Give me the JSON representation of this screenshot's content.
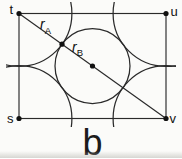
{
  "figure": {
    "type": "unit-cell-atomic-packing-diagram",
    "sublabel": "b",
    "background": "#fbfbf9",
    "line_color": "#2a2a2a",
    "dot_color": "#111111"
  },
  "corner_labels": {
    "top_left": "t",
    "top_right": "u",
    "bottom_left": "s",
    "bottom_right": "v"
  },
  "radius_labels": {
    "corner_atom": {
      "base": "r",
      "sub": "A"
    },
    "center_atom": {
      "base": "r",
      "sub": "B"
    }
  },
  "geometry": {
    "cell": {
      "x": 19,
      "y": 13.5,
      "width": 147,
      "height": 105
    },
    "corners": {
      "t": {
        "x": 19,
        "y": 13.5
      },
      "u": {
        "x": 166,
        "y": 13.5
      },
      "s": {
        "x": 19,
        "y": 118.5
      },
      "v": {
        "x": 166,
        "y": 118.5
      }
    },
    "corner_atom_radius": 52.9,
    "center_atom": {
      "cx": 92.5,
      "cy": 66,
      "r": 37.5
    },
    "contact_point": {
      "cx": 62,
      "cy": 44.2
    },
    "dot_radius": 2.6,
    "arc_clip": {
      "x": 6,
      "y": 2,
      "width": 170,
      "height": 125
    }
  }
}
